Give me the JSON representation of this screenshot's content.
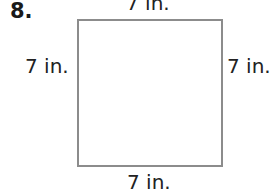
{
  "problem": {
    "number": "8.",
    "shape": "square",
    "labels": {
      "top": "7 in.",
      "left": "7 in.",
      "right": "7 in.",
      "bottom": "7 in."
    }
  }
}
